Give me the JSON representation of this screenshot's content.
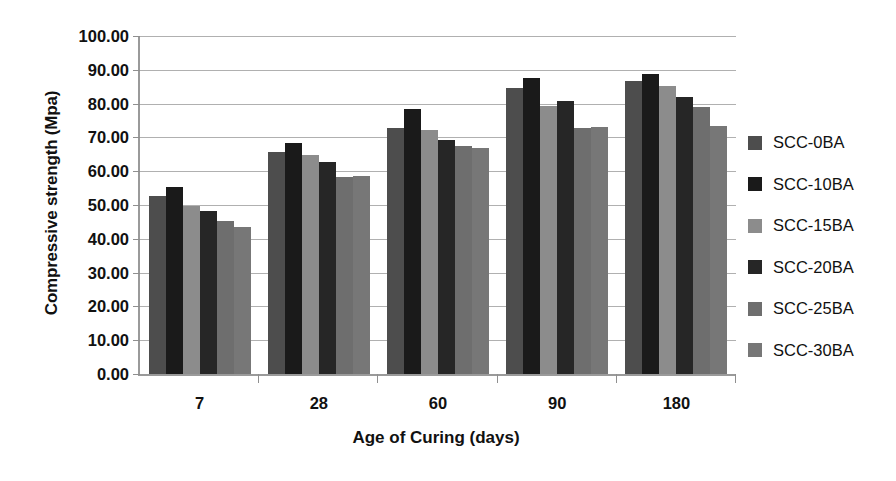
{
  "chart_data": {
    "type": "bar",
    "title": "",
    "xlabel": "Age of Curing (days)",
    "ylabel": "Compressive strength (Mpa)",
    "categories": [
      "7",
      "28",
      "60",
      "90",
      "180"
    ],
    "ylim": [
      0,
      100
    ],
    "ytick_step": 10,
    "ytick_labels": [
      "100.00",
      "90.00",
      "80.00",
      "70.00",
      "60.00",
      "50.00",
      "40.00",
      "30.00",
      "20.00",
      "10.00",
      "0.00"
    ],
    "ytick_values": [
      100,
      90,
      80,
      70,
      60,
      50,
      40,
      30,
      20,
      10,
      0
    ],
    "grid": true,
    "legend_position": "right",
    "series": [
      {
        "name": "SCC-0BA",
        "color": "#4d4d4d",
        "values": [
          52.6,
          65.8,
          72.8,
          84.5,
          86.8
        ]
      },
      {
        "name": "SCC-10BA",
        "color": "#1a1a1a",
        "values": [
          55.3,
          68.2,
          78.3,
          87.7,
          88.9
        ]
      },
      {
        "name": "SCC-15BA",
        "color": "#8c8c8c",
        "values": [
          49.8,
          64.8,
          72.2,
          79.4,
          85.2
        ]
      },
      {
        "name": "SCC-20BA",
        "color": "#262626",
        "values": [
          48.2,
          62.8,
          69.3,
          80.8,
          81.9
        ]
      },
      {
        "name": "SCC-25BA",
        "color": "#6e6e6e",
        "values": [
          45.3,
          58.3,
          67.4,
          72.9,
          78.9
        ]
      },
      {
        "name": "SCC-30BA",
        "color": "#777777",
        "values": [
          43.4,
          58.6,
          66.9,
          73.2,
          73.3
        ]
      }
    ]
  }
}
